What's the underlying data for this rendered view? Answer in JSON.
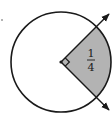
{
  "diagram": {
    "type": "circle-sector",
    "fraction": {
      "numerator": "1",
      "denominator": "4"
    },
    "angle_marker": "right-angle",
    "colors": {
      "stroke": "#1a1a1a",
      "sector_fill": "#b3b3b3",
      "background": "#ffffff"
    },
    "geometry": {
      "center": [
        61,
        62
      ],
      "radius": 50,
      "ray_angles_deg": [
        45,
        -45
      ]
    }
  }
}
